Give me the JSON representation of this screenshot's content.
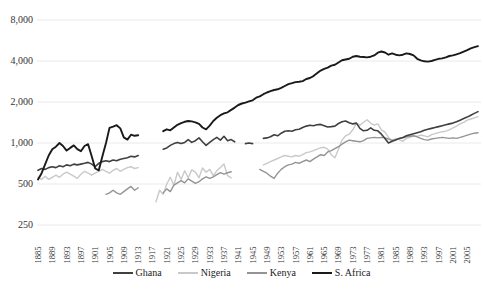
{
  "chart_data": {
    "type": "line",
    "title": "",
    "xlabel": "",
    "ylabel": "",
    "y_scale": "log",
    "ylim": [
      250,
      8000
    ],
    "grid": "horizontal",
    "gridline_color": "#eaeaea",
    "legend_position": "bottom",
    "x_start_year": 1885,
    "x_end_year": 2008,
    "y_ticks": [
      {
        "label": "8,000",
        "value": 8000
      },
      {
        "label": "4,000",
        "value": 4000
      },
      {
        "label": "2,000",
        "value": 2000
      },
      {
        "label": "1,000",
        "value": 1000
      },
      {
        "label": "500",
        "value": 500
      },
      {
        "label": "250",
        "value": 250
      }
    ],
    "x_tick_labels": [
      "1885",
      "1889",
      "1893",
      "1897",
      "1901",
      "1905",
      "1909",
      "1913",
      "1917",
      "1921",
      "1925",
      "1929",
      "1933",
      "1937",
      "1941",
      "1945",
      "1949",
      "1953",
      "1957",
      "1961",
      "1965",
      "1969",
      "1973",
      "1977",
      "1981",
      "1985",
      "1989",
      "1993",
      "1997",
      "2001",
      "2005"
    ],
    "x_tick_step_years": 4,
    "series": [
      {
        "name": "Ghana",
        "color": "#404040",
        "width": 1.6,
        "values": [
          630,
          650,
          640,
          660,
          670,
          660,
          680,
          670,
          690,
          680,
          700,
          690,
          700,
          710,
          720,
          700,
          670,
          710,
          730,
          740,
          730,
          750,
          740,
          760,
          770,
          780,
          800,
          790,
          810,
          null,
          null,
          null,
          null,
          null,
          null,
          900,
          920,
          960,
          990,
          1010,
          990,
          1010,
          1060,
          1010,
          1040,
          1090,
          1020,
          960,
          1010,
          1060,
          1100,
          1050,
          1120,
          1040,
          1060,
          1020,
          null,
          null,
          990,
          1000,
          990,
          null,
          null,
          1080,
          1090,
          1110,
          1150,
          1130,
          1180,
          1220,
          1230,
          1220,
          1250,
          1260,
          1300,
          1330,
          1350,
          1340,
          1360,
          1370,
          1340,
          1310,
          1320,
          1330,
          1390,
          1430,
          1450,
          1410,
          1380,
          1400,
          1280,
          1230,
          1240,
          1290,
          1240,
          1230,
          1160,
          1080,
          1000,
          1030,
          1050,
          1080,
          1100,
          1130,
          1150,
          1170,
          1190,
          1210,
          1240,
          1260,
          1280,
          1300,
          1320,
          1340,
          1360,
          1380,
          1400,
          1430,
          1470,
          1510,
          1550,
          1600,
          1650,
          1700
        ]
      },
      {
        "name": "Nigeria",
        "color": "#c9c9c9",
        "width": 1.4,
        "values": [
          560,
          540,
          570,
          540,
          560,
          580,
          560,
          590,
          610,
          590,
          570,
          550,
          590,
          620,
          600,
          580,
          600,
          620,
          640,
          620,
          600,
          630,
          650,
          620,
          640,
          660,
          670,
          650,
          660,
          null,
          null,
          null,
          null,
          370,
          450,
          420,
          500,
          560,
          490,
          610,
          540,
          625,
          555,
          635,
          610,
          555,
          655,
          610,
          640,
          575,
          625,
          660,
          700,
          575,
          555,
          null,
          null,
          null,
          null,
          null,
          null,
          null,
          null,
          690,
          710,
          730,
          750,
          770,
          790,
          810,
          800,
          790,
          810,
          800,
          820,
          850,
          860,
          880,
          900,
          920,
          930,
          900,
          820,
          780,
          900,
          1050,
          1130,
          1160,
          1250,
          1400,
          1350,
          1420,
          1480,
          1400,
          1350,
          1380,
          1250,
          1200,
          1100,
          1020,
          1080,
          1060,
          1030,
          1080,
          1100,
          1130,
          1120,
          1140,
          1130,
          1110,
          1150,
          1170,
          1190,
          1210,
          1220,
          1250,
          1290,
          1330,
          1380,
          1420,
          1470,
          1500,
          1530,
          1560
        ]
      },
      {
        "name": "Kenya",
        "color": "#949494",
        "width": 1.4,
        "values": [
          null,
          null,
          null,
          null,
          null,
          null,
          null,
          null,
          null,
          null,
          null,
          null,
          null,
          null,
          null,
          null,
          null,
          null,
          null,
          420,
          430,
          450,
          430,
          420,
          440,
          460,
          480,
          450,
          470,
          null,
          null,
          null,
          null,
          null,
          null,
          430,
          460,
          440,
          490,
          510,
          530,
          510,
          545,
          525,
          505,
          520,
          545,
          565,
          550,
          565,
          585,
          605,
          590,
          605,
          615,
          null,
          null,
          null,
          null,
          null,
          null,
          null,
          640,
          620,
          600,
          570,
          550,
          600,
          640,
          670,
          690,
          700,
          720,
          710,
          730,
          750,
          730,
          760,
          790,
          820,
          810,
          860,
          880,
          910,
          940,
          980,
          1020,
          1050,
          1040,
          1030,
          1020,
          1040,
          1080,
          1090,
          1100,
          1090,
          1100,
          1090,
          1070,
          1050,
          1060,
          1080,
          1090,
          1110,
          1120,
          1130,
          1110,
          1080,
          1060,
          1050,
          1070,
          1080,
          1090,
          1100,
          1090,
          1080,
          1090,
          1080,
          1100,
          1120,
          1140,
          1160,
          1180,
          1190
        ]
      },
      {
        "name": "S. Africa",
        "color": "#1a1a1a",
        "width": 1.9,
        "values": [
          540,
          600,
          700,
          810,
          900,
          940,
          1000,
          950,
          880,
          920,
          960,
          900,
          870,
          950,
          980,
          800,
          650,
          630,
          800,
          1000,
          1290,
          1320,
          1350,
          1280,
          1100,
          1060,
          1150,
          1130,
          1140,
          null,
          null,
          null,
          null,
          null,
          null,
          1220,
          1260,
          1240,
          1300,
          1360,
          1400,
          1430,
          1450,
          1440,
          1420,
          1380,
          1300,
          1260,
          1340,
          1450,
          1530,
          1600,
          1650,
          1680,
          1750,
          1820,
          1900,
          1950,
          1980,
          2020,
          2060,
          2150,
          2200,
          2280,
          2350,
          2400,
          2450,
          2480,
          2540,
          2620,
          2700,
          2750,
          2800,
          2820,
          2850,
          2950,
          3000,
          3100,
          3250,
          3400,
          3500,
          3580,
          3700,
          3750,
          3900,
          4050,
          4100,
          4150,
          4300,
          4350,
          4300,
          4280,
          4250,
          4300,
          4400,
          4600,
          4700,
          4620,
          4450,
          4550,
          4450,
          4400,
          4450,
          4550,
          4500,
          4400,
          4150,
          4050,
          3980,
          3960,
          4000,
          4080,
          4150,
          4180,
          4250,
          4350,
          4400,
          4480,
          4560,
          4680,
          4800,
          4950,
          5050,
          5150
        ]
      }
    ],
    "draw_order": [
      1,
      2,
      0,
      3
    ]
  }
}
